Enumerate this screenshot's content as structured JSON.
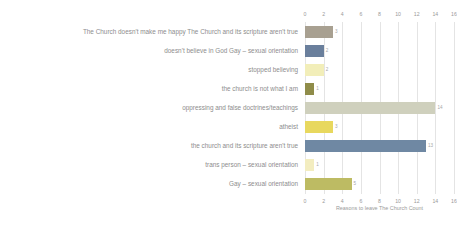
{
  "chart_data": {
    "type": "bar",
    "orientation": "horizontal",
    "title": "",
    "xlabel": "Reasons to leave The Church Count",
    "ylabel": "",
    "xlim": [
      0,
      16
    ],
    "xticks": [
      "0",
      "2",
      "4",
      "6",
      "8",
      "10",
      "12",
      "14",
      "16"
    ],
    "grid": true,
    "legend": "none",
    "categories": [
      "The Church doesn't make me happy The Church and its scripture aren't true",
      "doesn't believe in God Gay – sexual orientation",
      "stopped believing",
      "the church is not what I am",
      "oppressing and false doctrines/teachings",
      "atheist",
      "the church and its scripture aren't true",
      "trans person – sexual orientation",
      "Gay – sexual orientation"
    ],
    "values": [
      3,
      2,
      2,
      1,
      14,
      3,
      13,
      1,
      5
    ],
    "bar_colors": [
      "#a8a091",
      "#6a7f9c",
      "#f2eeb9",
      "#8f8c49",
      "#cfd0bd",
      "#e8d85e",
      "#6f88a3",
      "#f3edc0",
      "#bdbb63"
    ],
    "value_labels": [
      "3",
      "2",
      "2",
      "1",
      "14",
      "3",
      "13",
      "1",
      "5"
    ]
  },
  "colors": {
    "background": "#ffffff",
    "gridline": "#e4e4e4",
    "text": "#8d8d8d",
    "axis_text": "#9a9a9a"
  }
}
